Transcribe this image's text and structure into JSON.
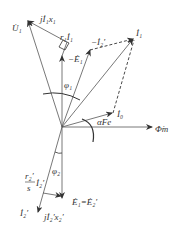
{
  "diagram": {
    "origin": {
      "x": 62,
      "y": 127
    },
    "colors": {
      "line": "#555555",
      "arrow": "#333333",
      "text": "#333333"
    },
    "labels": {
      "U1": "U̇₁",
      "jI1x1": "jİ₁x₁",
      "r1I1": "r₁İ₁",
      "negE1": "−Ė₁",
      "negI2p": "−İ₂′",
      "I1": "İ₁",
      "phi1": "φ₁",
      "I0": "İ₀",
      "alphaFe": "αFe",
      "Phim": "Φ̇m",
      "phi2": "φ₂",
      "r2s_num": "r₂′",
      "r2s_den": "s",
      "r2s_I": "İ₂′",
      "I2p": "İ₂′",
      "jI2x2": "jİ₂′x₂′",
      "E1eqE2": "Ė₁=Ė₂′"
    },
    "vectors": [
      {
        "name": "U1",
        "from": [
          62,
          127
        ],
        "to": [
          27,
          20
        ]
      },
      {
        "name": "negE1",
        "from": [
          62,
          127
        ],
        "to": [
          91,
          49
        ]
      },
      {
        "name": "I1",
        "from": [
          62,
          127
        ],
        "to": [
          134,
          38
        ]
      },
      {
        "name": "I0",
        "from": [
          62,
          127
        ],
        "to": [
          113,
          113
        ]
      },
      {
        "name": "Phim",
        "from": [
          62,
          127
        ],
        "to": [
          152,
          127
        ]
      },
      {
        "name": "E1eqE2",
        "from": [
          62,
          127
        ],
        "to": [
          62,
          198
        ]
      },
      {
        "name": "I2p",
        "from": [
          62,
          127
        ],
        "to": [
          38,
          212
        ]
      }
    ]
  }
}
